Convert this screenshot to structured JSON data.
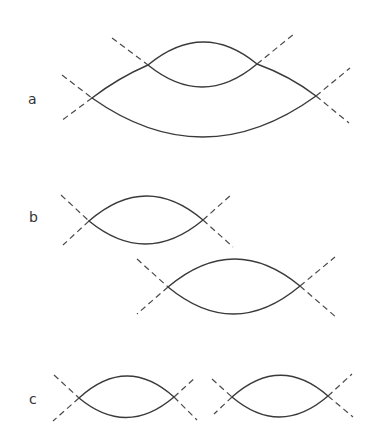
{
  "figure": {
    "colors": {
      "line": "#3a3a3a",
      "dashed": "#4a4a4a",
      "background": "#ffffff"
    },
    "panels": [
      {
        "label": "a",
        "description": "Large lens with a smaller lens intersecting its upper arc; dashed asymptote lines crossing at each of the four vertices",
        "lenses": [
          {
            "name": "outer",
            "left": [
              92,
              98
            ],
            "right": [
              316,
              96
            ]
          },
          {
            "name": "inner",
            "left": [
              148,
              65
            ],
            "right": [
              257,
              64
            ]
          }
        ]
      },
      {
        "label": "b",
        "description": "Two separate lenses, the second offset down-right from the first, each with dashed crossing lines at its vertices",
        "lenses": [
          {
            "name": "upper",
            "left": [
              89,
              221
            ],
            "right": [
              203,
              220
            ]
          },
          {
            "name": "lower",
            "left": [
              168,
              287
            ],
            "right": [
              300,
              286
            ]
          }
        ]
      },
      {
        "label": "c",
        "description": "Two lenses side by side on the same level, each with dashed crossing lines at its vertices",
        "lenses": [
          {
            "name": "left",
            "left": [
              79,
              398
            ],
            "right": [
              174,
              397
            ]
          },
          {
            "name": "right",
            "left": [
              232,
              397
            ],
            "right": [
              328,
              396
            ]
          }
        ]
      }
    ]
  }
}
